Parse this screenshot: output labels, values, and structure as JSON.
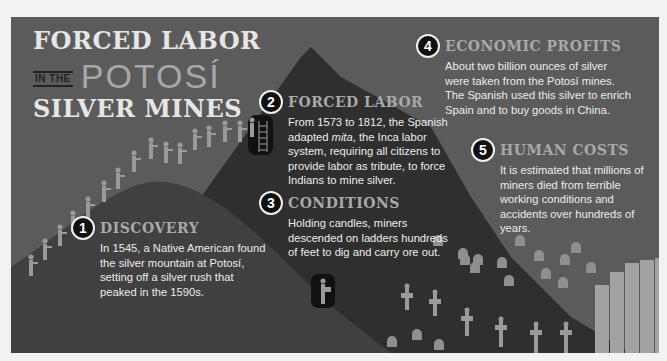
{
  "title": {
    "line1": "FORCED LABOR",
    "in_the": "IN THE",
    "potosi": "POTOSÍ",
    "line3": "SILVER MINES"
  },
  "callouts": [
    {
      "number": "1",
      "heading": "DISCOVERY",
      "body": "In 1545, a Native American found the silver mountain at Potosí, setting off a silver rush that peaked in the 1590s."
    },
    {
      "number": "2",
      "heading": "FORCED LABOR",
      "body_pre": "From 1573 to 1812, the Spanish adapted ",
      "body_em": "mita",
      "body_post": ", the Inca labor system, requiring all citizens to provide labor as tribute, to force Indians to mine silver."
    },
    {
      "number": "3",
      "heading": "CONDITIONS",
      "body": "Holding candles, miners descended on ladders hundreds of feet to dig and carry ore out."
    },
    {
      "number": "4",
      "heading": "ECONOMIC PROFITS",
      "body": "About two billion ounces of silver were taken from the Potosí mines. The Spanish used this silver to enrich Spain and to buy goods in China."
    },
    {
      "number": "5",
      "heading": "HUMAN COSTS",
      "body": "It is estimated that millions of miners died from terrible working conditions and accidents over hundreds of years."
    }
  ],
  "illustration": {
    "icons": [
      "mountain-icon",
      "worker-figure-icon",
      "mine-entrance-icon",
      "ladder-icon",
      "tombstone-icon",
      "grave-cross-icon",
      "silver-bars-icon"
    ],
    "colors": {
      "background": "#5b5b5b",
      "mountain_far": "#2e2e2e",
      "mountain_near": "#3d3d3d",
      "figures": "#9a9a9a",
      "heading_gray": "#a9a9a9",
      "text": "#ececec"
    }
  }
}
